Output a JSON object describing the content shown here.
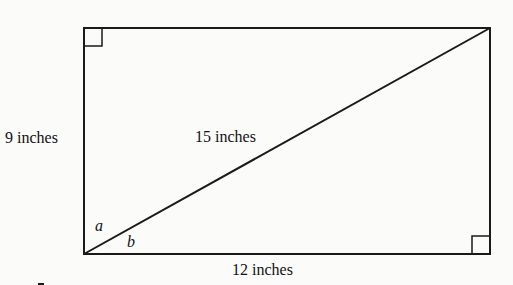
{
  "diagram": {
    "type": "rectangle-with-diagonal",
    "labels": {
      "left_side": "9 inches",
      "diagonal": "15 inches",
      "bottom_side": "12 inches",
      "angle_a": "a",
      "angle_b": "b"
    },
    "right_angle_markers": [
      "top-left",
      "bottom-right"
    ],
    "colors": {
      "stroke": "#1a1a1a",
      "background": "#fbfbfa"
    }
  }
}
